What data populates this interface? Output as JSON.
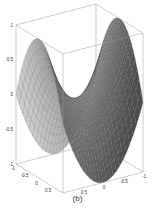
{
  "chart_data": {
    "type": "surface3d",
    "title": "",
    "caption": "(b)",
    "function": "z = x^2 - y^2 (saddle / hyperbolic paraboloid)",
    "xlabel": "",
    "ylabel": "",
    "zlabel": "",
    "x_ticks": [
      "-1",
      "-0.5",
      "0",
      "0.5",
      "1"
    ],
    "y_ticks": [
      "1",
      "0.5",
      "0",
      "-0.5",
      "-1"
    ],
    "z_ticks": [
      "1",
      "0.5",
      "0",
      "-0.5",
      "-1"
    ],
    "xlim": [
      -1,
      1
    ],
    "ylim": [
      -1,
      1
    ],
    "zlim": [
      -1,
      1
    ],
    "grid_resolution": 24,
    "colormap": "gray",
    "box": true
  },
  "colors": {
    "surface_dark": "#5a5a5a",
    "surface_light": "#bdbdbd",
    "mesh": "#3a3a3a",
    "box": "#9a9a9a"
  }
}
